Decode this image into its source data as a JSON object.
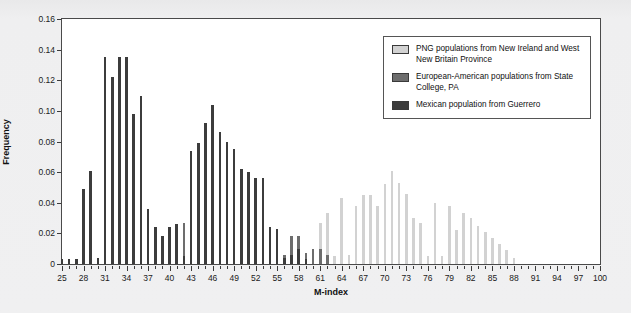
{
  "chart_data": {
    "type": "bar",
    "title": "",
    "subtitle": "",
    "xlabel": "M-index",
    "ylabel": "Frequency",
    "xlim": [
      25,
      100
    ],
    "ylim": [
      0,
      0.16
    ],
    "ytick_values": [
      0,
      0.02,
      0.04,
      0.06,
      0.08,
      0.1,
      0.12,
      0.14,
      0.16
    ],
    "ytick_labels": [
      "0",
      "0.02",
      "0.04",
      "0.06",
      "0.08",
      "0.10",
      "0.12",
      "0.14",
      "0.16"
    ],
    "xtick_major": [
      25,
      28,
      31,
      34,
      37,
      40,
      43,
      46,
      49,
      52,
      55,
      58,
      61,
      64,
      67,
      70,
      73,
      76,
      79,
      82,
      85,
      88,
      91,
      94,
      97,
      100
    ],
    "xtick_minor_step": 1,
    "grid": false,
    "legend_position": "top-right",
    "bar_style": "overlapping-thin-vertical-lines",
    "series": [
      {
        "name": "PNG populations from New Ireland and West New Britain Province",
        "color": "#d2d2d2",
        "x": [
          55,
          56,
          57,
          58,
          59,
          60,
          61,
          62,
          63,
          64,
          65,
          66,
          67,
          68,
          69,
          70,
          71,
          72,
          73,
          74,
          75,
          76,
          77,
          78,
          79,
          80,
          81,
          82,
          83,
          84,
          85,
          86,
          87,
          88
        ],
        "values": [
          0.004,
          0.006,
          0.01,
          0.013,
          0.004,
          0.005,
          0.027,
          0.033,
          0.005,
          0.043,
          0.006,
          0.038,
          0.045,
          0.045,
          0.038,
          0.052,
          0.061,
          0.053,
          0.046,
          0.03,
          0.027,
          0.005,
          0.04,
          0.005,
          0.038,
          0.022,
          0.033,
          0.03,
          0.025,
          0.021,
          0.017,
          0.013,
          0.009,
          0.004
        ]
      },
      {
        "name": "European-American populations from State College, PA",
        "color": "#6d6d6d",
        "x": [
          36,
          37,
          38,
          39,
          40,
          41,
          42,
          43,
          44,
          45,
          46,
          47,
          48,
          49,
          50,
          51,
          52,
          53,
          54,
          55,
          56,
          57,
          58,
          59,
          60,
          61,
          62
        ],
        "values": [
          0.005,
          0.013,
          0.01,
          0.005,
          0.013,
          0.006,
          0.027,
          0.044,
          0.055,
          0.065,
          0.083,
          0.07,
          0.057,
          0.066,
          0.055,
          0.038,
          0.033,
          0.033,
          0.015,
          0.012,
          0.006,
          0.018,
          0.018,
          0.007,
          0.01,
          0.01,
          0.006
        ]
      },
      {
        "name": "Mexican population from Guerrero",
        "color": "#3c3c3c",
        "x": [
          25,
          26,
          27,
          28,
          29,
          30,
          31,
          32,
          33,
          34,
          35,
          36,
          37,
          38,
          39,
          40,
          41,
          42,
          43,
          44,
          45,
          46,
          47,
          48,
          49,
          50,
          51,
          52,
          53,
          54,
          55,
          56,
          57,
          58,
          59
        ],
        "values": [
          0.003,
          0.003,
          0.003,
          0.049,
          0.061,
          0.004,
          0.135,
          0.122,
          0.135,
          0.135,
          0.098,
          0.11,
          0.036,
          0.024,
          0.018,
          0.024,
          0.026,
          0.005,
          0.074,
          0.079,
          0.092,
          0.104,
          0.086,
          0.08,
          0.075,
          0.062,
          0.06,
          0.056,
          0.056,
          0.024,
          0.023,
          0.004,
          0.006,
          0.01,
          0.003
        ]
      }
    ]
  },
  "legend": {
    "items": [
      {
        "label": "PNG populations from New Ireland and West New Britain Province",
        "color": "#d2d2d2"
      },
      {
        "label": "European-American populations from State College, PA",
        "color": "#6d6d6d"
      },
      {
        "label": "Mexican population from Guerrero",
        "color": "#3c3c3c"
      }
    ]
  },
  "axes": {
    "y_title": "Frequency",
    "x_title": "M-index"
  }
}
